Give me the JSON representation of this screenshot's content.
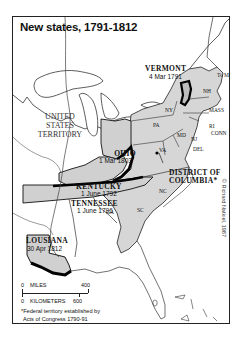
{
  "title": "New states, 1791-1812",
  "colors": {
    "new_state_fill": "#cfcfcf",
    "original_states_fill": "#d9d9d9",
    "territory_fill": "#ffffff",
    "border": "#111111",
    "frame": "#222222"
  },
  "territory": {
    "line1": "UNITED",
    "line2": "STATES",
    "line3": "TERRITORY"
  },
  "new_states": [
    {
      "name": "VERMONT",
      "date": "4 Mar 1791"
    },
    {
      "name": "KENTUCKY",
      "date": "1 June 1792"
    },
    {
      "name": "TENNESSEE",
      "date": "1 June 1796"
    },
    {
      "name": "OHIO",
      "date": "1 Mar 1803"
    },
    {
      "name": "LOUSIANA",
      "date": "30 Apr 1812"
    }
  ],
  "district": {
    "line1": "DISTRICT OF",
    "line2": "COLUMBIA*"
  },
  "state_abbrevs": [
    "To Mass",
    "NH",
    "MASS",
    "NY",
    "RI",
    "CONN",
    "PA",
    "MD",
    "NJ",
    "DEL",
    "VA",
    "NC",
    "SC",
    "GA"
  ],
  "scale": {
    "miles_label": "MILES",
    "miles_zero": "0",
    "miles_max": "400",
    "km_zero": "0",
    "km_label": "KILOMETERS",
    "km_max": "600"
  },
  "footnote": {
    "line1": "*Federal territory established by",
    "line2": "Acts of Congress 1790-91"
  },
  "credit": "© Richard Natkiel, 1987"
}
